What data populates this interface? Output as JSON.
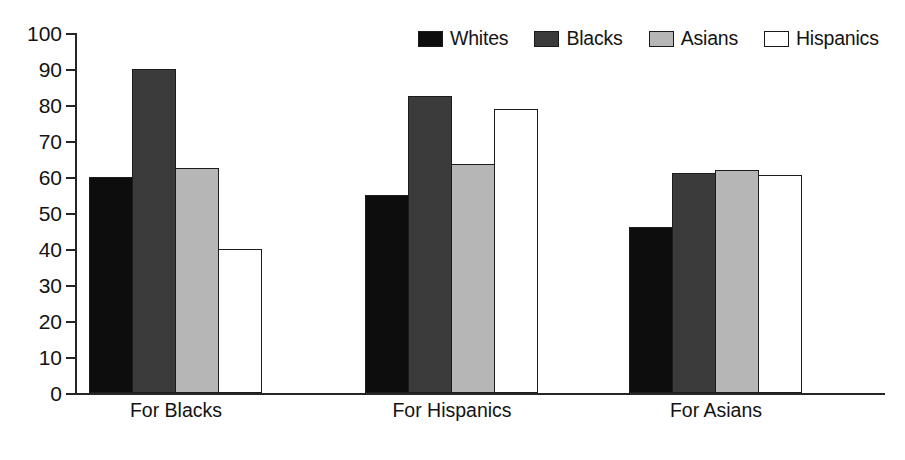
{
  "chart_data": {
    "type": "bar",
    "title": "",
    "xlabel": "",
    "ylabel": "",
    "ylim": [
      0,
      100
    ],
    "yticks": [
      0,
      10,
      20,
      30,
      40,
      50,
      60,
      70,
      80,
      90,
      100
    ],
    "ytick_labels": [
      "0",
      "10",
      "20",
      "30",
      "40",
      "50",
      "60",
      "70",
      "80",
      "90",
      "100"
    ],
    "grid": false,
    "legend_position": "top-right",
    "categories": [
      "For Blacks",
      "For Hispanics",
      "For Asians"
    ],
    "series": [
      {
        "name": "Whites",
        "color": "#0d0d0d",
        "values": [
          60,
          55,
          46
        ]
      },
      {
        "name": "Blacks",
        "color": "#3b3b3b",
        "values": [
          90,
          82.5,
          61
        ]
      },
      {
        "name": "Asians",
        "color": "#b6b6b6",
        "values": [
          62.5,
          63.5,
          62
        ]
      },
      {
        "name": "Hispanics",
        "color": "#ffffff",
        "values": [
          40,
          79,
          60.5
        ]
      }
    ]
  },
  "legend": {
    "items": [
      {
        "label": "Whites",
        "swatch": "legend-swatch-whites"
      },
      {
        "label": "Blacks",
        "swatch": "legend-swatch-blacks"
      },
      {
        "label": "Asians",
        "swatch": "legend-swatch-asians"
      },
      {
        "label": "Hispanics",
        "swatch": "legend-swatch-hispanics"
      }
    ]
  }
}
